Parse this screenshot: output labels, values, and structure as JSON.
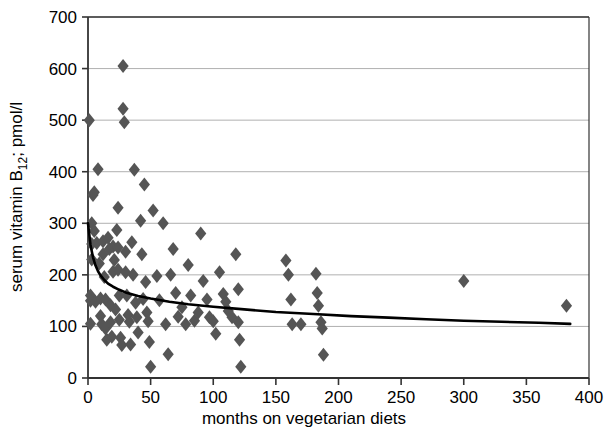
{
  "chart_data": {
    "type": "scatter",
    "title": "",
    "xlabel": "months on vegetarian diets",
    "ylabel_main": "serum vitamin B",
    "ylabel_sub": "12",
    "ylabel_tail": "; pmol/l",
    "ylabel_full": "serum vitamin B12; pmol/l",
    "xlim": [
      0,
      400
    ],
    "ylim": [
      0,
      700
    ],
    "xticks": [
      0,
      50,
      100,
      150,
      200,
      250,
      300,
      350,
      400
    ],
    "yticks": [
      0,
      100,
      200,
      300,
      400,
      500,
      600,
      700
    ],
    "grid": "horizontal",
    "legend": "none",
    "marker": "diamond",
    "marker_color": "#555555",
    "marker_size": 7,
    "curve_color": "#000000",
    "curve_width": 2.6,
    "grid_color": "#b0b0b0",
    "axis_color": "#333333",
    "points": [
      [
        1,
        500
      ],
      [
        2,
        160
      ],
      [
        2,
        150
      ],
      [
        2,
        105
      ],
      [
        3,
        300
      ],
      [
        3,
        260
      ],
      [
        3,
        230
      ],
      [
        4,
        355
      ],
      [
        5,
        360
      ],
      [
        5,
        285
      ],
      [
        6,
        148
      ],
      [
        7,
        262
      ],
      [
        8,
        405
      ],
      [
        9,
        222
      ],
      [
        10,
        154
      ],
      [
        10,
        120
      ],
      [
        11,
        104
      ],
      [
        12,
        265
      ],
      [
        12,
        240
      ],
      [
        13,
        196
      ],
      [
        14,
        152
      ],
      [
        14,
        96
      ],
      [
        15,
        74
      ],
      [
        16,
        272
      ],
      [
        17,
        250
      ],
      [
        18,
        141
      ],
      [
        18,
        108
      ],
      [
        19,
        80
      ],
      [
        20,
        255
      ],
      [
        20,
        206
      ],
      [
        21,
        229
      ],
      [
        22,
        133
      ],
      [
        23,
        287
      ],
      [
        24,
        330
      ],
      [
        24,
        253
      ],
      [
        24,
        210
      ],
      [
        25,
        160
      ],
      [
        25,
        113
      ],
      [
        26,
        78
      ],
      [
        27,
        64
      ],
      [
        28,
        605
      ],
      [
        28,
        522
      ],
      [
        29,
        496
      ],
      [
        30,
        245
      ],
      [
        30,
        205
      ],
      [
        31,
        160
      ],
      [
        32,
        122
      ],
      [
        33,
        109
      ],
      [
        34,
        65
      ],
      [
        35,
        263
      ],
      [
        36,
        200
      ],
      [
        37,
        404
      ],
      [
        38,
        146
      ],
      [
        39,
        118
      ],
      [
        40,
        88
      ],
      [
        42,
        305
      ],
      [
        43,
        240
      ],
      [
        44,
        153
      ],
      [
        45,
        375
      ],
      [
        46,
        186
      ],
      [
        47,
        127
      ],
      [
        48,
        110
      ],
      [
        49,
        70
      ],
      [
        50,
        22
      ],
      [
        52,
        325
      ],
      [
        55,
        198
      ],
      [
        57,
        151
      ],
      [
        60,
        300
      ],
      [
        62,
        104
      ],
      [
        64,
        46
      ],
      [
        66,
        200
      ],
      [
        68,
        250
      ],
      [
        70,
        165
      ],
      [
        72,
        119
      ],
      [
        75,
        137
      ],
      [
        78,
        104
      ],
      [
        80,
        219
      ],
      [
        82,
        160
      ],
      [
        85,
        111
      ],
      [
        88,
        127
      ],
      [
        90,
        280
      ],
      [
        92,
        188
      ],
      [
        95,
        152
      ],
      [
        97,
        118
      ],
      [
        100,
        110
      ],
      [
        102,
        86
      ],
      [
        105,
        205
      ],
      [
        108,
        163
      ],
      [
        110,
        148
      ],
      [
        112,
        130
      ],
      [
        115,
        118
      ],
      [
        118,
        240
      ],
      [
        120,
        172
      ],
      [
        120,
        108
      ],
      [
        121,
        74
      ],
      [
        122,
        22
      ],
      [
        158,
        228
      ],
      [
        160,
        200
      ],
      [
        162,
        152
      ],
      [
        163,
        104
      ],
      [
        170,
        104
      ],
      [
        182,
        202
      ],
      [
        183,
        165
      ],
      [
        184,
        140
      ],
      [
        186,
        108
      ],
      [
        187,
        96
      ],
      [
        188,
        45
      ],
      [
        300,
        188
      ],
      [
        382,
        140
      ]
    ],
    "fit_curve": {
      "description": "fitted decreasing power curve",
      "x": [
        0,
        2,
        4,
        6,
        8,
        10,
        13,
        16,
        20,
        25,
        30,
        40,
        50,
        65,
        80,
        100,
        120,
        150,
        180,
        210,
        240,
        270,
        300,
        330,
        360,
        385
      ],
      "y": [
        300,
        258,
        234,
        218,
        207,
        199,
        190,
        183,
        177,
        171,
        166,
        159,
        154,
        148,
        143,
        138,
        134,
        128,
        124,
        120,
        117,
        114,
        111,
        109,
        107,
        105
      ]
    }
  }
}
